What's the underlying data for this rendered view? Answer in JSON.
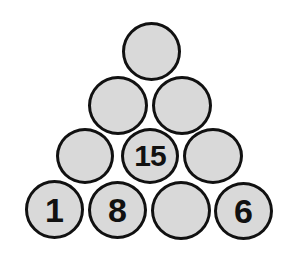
{
  "puzzle": {
    "type": "number-pyramid",
    "ball_fill": "#d9d9d9",
    "ball_border": "#111111",
    "rows": [
      {
        "balls": [
          {
            "value": ""
          }
        ]
      },
      {
        "balls": [
          {
            "value": ""
          },
          {
            "value": ""
          }
        ]
      },
      {
        "balls": [
          {
            "value": ""
          },
          {
            "value": "15"
          },
          {
            "value": ""
          }
        ]
      },
      {
        "balls": [
          {
            "value": "1"
          },
          {
            "value": "8"
          },
          {
            "value": ""
          },
          {
            "value": "6"
          }
        ]
      }
    ]
  }
}
